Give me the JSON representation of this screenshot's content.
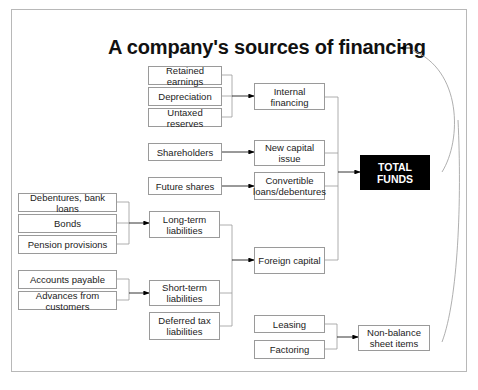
{
  "diagram": {
    "title": "A company's sources of financing",
    "sources": {
      "internal": [
        "Retained earnings",
        "Depreciation",
        "Untaxed reserves"
      ],
      "equity": [
        "Shareholders",
        "Future shares"
      ],
      "long_term": [
        "Debentures, bank loans",
        "Bonds",
        "Pension provisions"
      ],
      "short_term": [
        "Accounts payable",
        "Advances from customers"
      ],
      "off_balance": [
        "Leasing",
        "Factoring"
      ]
    },
    "intermediate": {
      "internal_financing": "Internal financing",
      "new_capital_issue": "New capital issue",
      "convertible_loans": "Convertible loans/debentures",
      "long_term_liabilities": "Long-term liabilities",
      "short_term_liabilities": "Short-term liabilities",
      "deferred_tax_liabilities": "Deferred tax liabilities",
      "foreign_capital": "Foreign capital",
      "non_balance_sheet_items": "Non-balance sheet items"
    },
    "total": "TOTAL FUNDS",
    "colors": {
      "line": "#9a9a9a",
      "total_bg": "#000000",
      "total_text": "#ffffff"
    }
  }
}
